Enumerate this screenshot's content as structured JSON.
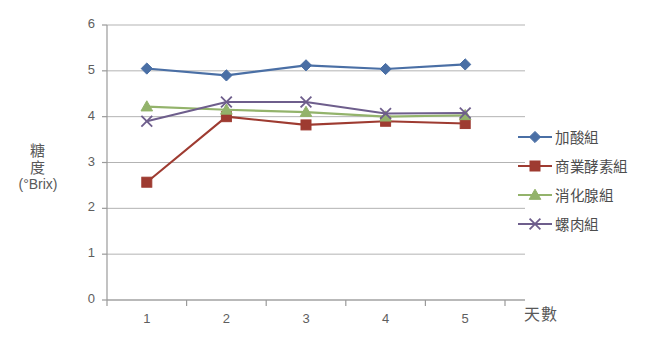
{
  "chart_data": {
    "type": "line",
    "title": "",
    "xlabel": "天數",
    "ylabel": "糖度 (°Brix)",
    "ylabel_lines": [
      "糖",
      "度",
      "(°Brix)"
    ],
    "x": [
      1,
      2,
      3,
      4,
      5
    ],
    "categories": [
      "1",
      "2",
      "3",
      "4",
      "5"
    ],
    "xtick_labels": [
      "1",
      "2",
      "3",
      "4",
      "5"
    ],
    "ytick_labels": [
      "0",
      "1",
      "2",
      "3",
      "4",
      "5",
      "6"
    ],
    "ylim": [
      0,
      6
    ],
    "xlim": [
      0.5,
      5.5
    ],
    "ytick_step": 1,
    "grid": "horizontal",
    "legend_position": "right",
    "series": [
      {
        "name": "加酸組",
        "color": "#4A6FA5",
        "marker": "diamond",
        "values": [
          5.05,
          4.9,
          5.12,
          5.04,
          5.14
        ]
      },
      {
        "name": "商業酵素組",
        "color": "#9E3B31",
        "marker": "square",
        "values": [
          2.57,
          4.0,
          3.82,
          3.9,
          3.85
        ]
      },
      {
        "name": "消化腺組",
        "color": "#93B36B",
        "marker": "triangle",
        "values": [
          4.22,
          4.15,
          4.1,
          4.0,
          4.03
        ]
      },
      {
        "name": "螺肉組",
        "color": "#6E5E8C",
        "marker": "x",
        "values": [
          3.9,
          4.32,
          4.32,
          4.07,
          4.08
        ]
      }
    ]
  },
  "legend": {
    "items": [
      {
        "label": "加酸組"
      },
      {
        "label": "商業酵素組"
      },
      {
        "label": "消化腺組"
      },
      {
        "label": "螺肉組"
      }
    ]
  },
  "colors": {
    "series_blue": "#4A6FA5",
    "series_red": "#9E3B31",
    "series_green": "#93B36B",
    "series_purple": "#6E5E8C",
    "grid": "#B3B3B3",
    "axis": "#9A9A9A",
    "text": "#5A5A5A",
    "background": "#FFFFFF"
  }
}
